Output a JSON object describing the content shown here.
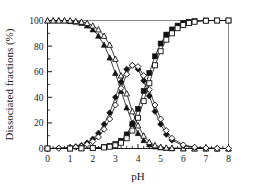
{
  "chart_data": {
    "type": "line",
    "title": "",
    "xlabel": "pH",
    "ylabel": "Dissociated fractions (%)",
    "xlim": [
      0,
      8
    ],
    "ylim": [
      0,
      100
    ],
    "xticks": [
      0,
      1,
      2,
      3,
      4,
      5,
      6,
      7,
      8
    ],
    "xtick_labels": [
      "0",
      "1",
      "2",
      "3",
      "4",
      "5",
      "6",
      "7",
      "8"
    ],
    "yticks": [
      0,
      20,
      40,
      60,
      80,
      100
    ],
    "ytick_labels": [
      "0",
      "20",
      "40",
      "60",
      "80",
      "100"
    ],
    "x_minor_tick_step": 0.25,
    "y_minor_tick_step": 10,
    "grid": false,
    "legend": "none",
    "frame_color": "#8a8a8a",
    "series_color": "#111111",
    "series": [
      {
        "name": "H3L undissociated (filled triangle)",
        "marker": "filled-triangle",
        "x": [
          0.0,
          0.25,
          0.5,
          0.75,
          1.0,
          1.25,
          1.5,
          1.75,
          2.0,
          2.25,
          2.5,
          2.75,
          3.0,
          3.25,
          3.5,
          3.75,
          4.0,
          4.25,
          4.5,
          4.75,
          5.0,
          5.25,
          5.5,
          6.0,
          6.5,
          7.0,
          7.5,
          8.0
        ],
        "values": [
          100,
          100,
          100,
          100,
          99.5,
          99,
          98,
          96,
          93,
          88,
          81,
          71,
          59,
          45,
          32,
          20,
          12,
          6.5,
          3.2,
          1.6,
          0.8,
          0.4,
          0.2,
          0.1,
          0,
          0,
          0,
          0
        ]
      },
      {
        "name": "H3L undissociated (open triangle)",
        "marker": "open-triangle",
        "x": [
          0.0,
          0.25,
          0.5,
          0.75,
          1.0,
          1.25,
          1.5,
          1.75,
          2.0,
          2.25,
          2.5,
          2.75,
          3.0,
          3.25,
          3.5,
          3.75,
          4.0,
          4.25,
          4.5,
          4.75,
          5.0,
          5.25,
          5.5,
          6.0,
          6.5,
          7.0,
          7.5,
          8.0
        ],
        "values": [
          100,
          100,
          100,
          100,
          100,
          99.5,
          99,
          98,
          96,
          93,
          88,
          81,
          70,
          57,
          43,
          29,
          18,
          10,
          5.0,
          2.5,
          1.2,
          0.6,
          0.3,
          0.1,
          0,
          0,
          0,
          0
        ]
      },
      {
        "name": "H2L- intermediate (filled diamond)",
        "marker": "filled-diamond",
        "x": [
          0.0,
          0.5,
          1.0,
          1.25,
          1.5,
          1.75,
          2.0,
          2.25,
          2.5,
          2.75,
          3.0,
          3.25,
          3.5,
          3.75,
          4.0,
          4.25,
          4.5,
          4.75,
          5.0,
          5.25,
          5.5,
          6.0,
          6.5,
          7.0,
          7.5,
          8.0
        ],
        "values": [
          0,
          0.3,
          0.8,
          1.5,
          2.5,
          4.5,
          7.5,
          12,
          19,
          28,
          40,
          52,
          62,
          65,
          62,
          53,
          41,
          29,
          19,
          11,
          6.5,
          2.2,
          0.8,
          0.3,
          0.1,
          0
        ]
      },
      {
        "name": "H2L- intermediate (open diamond)",
        "marker": "open-diamond",
        "x": [
          0.0,
          0.5,
          1.0,
          1.25,
          1.5,
          1.75,
          2.0,
          2.25,
          2.5,
          2.75,
          3.0,
          3.25,
          3.5,
          3.75,
          4.0,
          4.25,
          4.5,
          4.75,
          5.0,
          5.25,
          5.5,
          6.0,
          6.5,
          7.0,
          7.5,
          8.0
        ],
        "values": [
          0,
          0.2,
          0.5,
          1.0,
          1.8,
          3.2,
          5.5,
          9,
          15,
          23,
          34,
          47,
          58,
          65,
          64,
          57,
          46,
          34,
          23,
          14,
          8.0,
          2.8,
          1.0,
          0.4,
          0.1,
          0
        ]
      },
      {
        "name": "HL2- dissociated (filled square)",
        "marker": "filled-square",
        "x": [
          0.0,
          1.0,
          1.5,
          2.0,
          2.5,
          2.75,
          3.0,
          3.25,
          3.5,
          3.75,
          4.0,
          4.25,
          4.5,
          4.75,
          5.0,
          5.25,
          5.5,
          5.75,
          6.0,
          6.25,
          6.5,
          7.0,
          7.5,
          8.0
        ],
        "values": [
          0,
          0,
          0.2,
          0.5,
          1.2,
          2.0,
          3.5,
          6.0,
          11,
          19,
          31,
          45,
          59,
          72,
          82,
          89,
          93,
          96,
          98,
          99,
          99.5,
          100,
          100,
          100
        ]
      },
      {
        "name": "HL2- dissociated (open square)",
        "marker": "open-square",
        "x": [
          0.0,
          1.0,
          1.5,
          2.0,
          2.5,
          2.75,
          3.0,
          3.25,
          3.5,
          3.75,
          4.0,
          4.25,
          4.5,
          4.75,
          5.0,
          5.25,
          5.5,
          5.75,
          6.0,
          6.25,
          6.5,
          7.0,
          7.5,
          8.0
        ],
        "values": [
          0,
          0,
          0.1,
          0.3,
          0.8,
          1.4,
          2.5,
          4.5,
          8.0,
          14,
          24,
          37,
          51,
          65,
          76,
          85,
          90,
          94,
          96.5,
          98,
          99,
          99.8,
          100,
          100
        ]
      }
    ]
  }
}
